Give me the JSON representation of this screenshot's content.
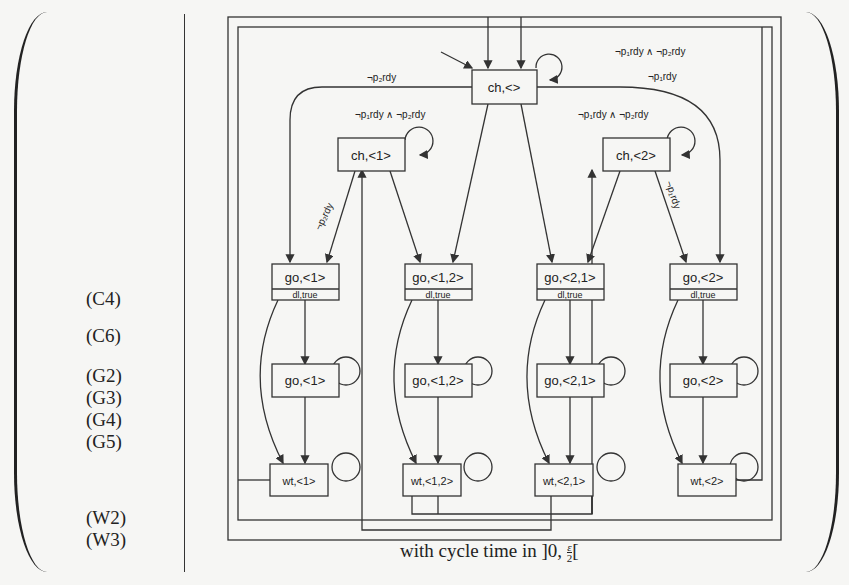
{
  "rule_labels": [
    {
      "id": "C4",
      "text": "(C4)",
      "top": 288
    },
    {
      "id": "C6",
      "text": "(C6)",
      "top": 325
    },
    {
      "id": "G2",
      "text": "(G2)",
      "top": 365
    },
    {
      "id": "G3",
      "text": "(G3)",
      "top": 387
    },
    {
      "id": "G4",
      "text": "(G4)",
      "top": 409
    },
    {
      "id": "G5",
      "text": "(G5)",
      "top": 431
    },
    {
      "id": "W2",
      "text": "(W2)",
      "top": 507
    },
    {
      "id": "W3",
      "text": "(W3)",
      "top": 529
    }
  ],
  "states": {
    "ch_empty": {
      "label": "ch,<>"
    },
    "ch_1": {
      "label": "ch,<1>"
    },
    "ch_2": {
      "label": "ch,<2>"
    },
    "go_1_dl": {
      "label": "go,<1>",
      "sub": "dl,true"
    },
    "go_12_dl": {
      "label": "go,<1,2>",
      "sub": "dl,true"
    },
    "go_21_dl": {
      "label": "go,<2,1>",
      "sub": "dl,true"
    },
    "go_2_dl": {
      "label": "go,<2>",
      "sub": "dl,true"
    },
    "go_1": {
      "label": "go,<1>"
    },
    "go_12": {
      "label": "go,<1,2>"
    },
    "go_21": {
      "label": "go,<2,1>"
    },
    "go_2": {
      "label": "go,<2>"
    },
    "wt_1": {
      "label": "wt,<1>"
    },
    "wt_12": {
      "label": "wt,<1,2>"
    },
    "wt_21": {
      "label": "wt,<2,1>"
    },
    "wt_2": {
      "label": "wt,<2>"
    }
  },
  "edge_labels": {
    "ch_empty_loop": "¬p₁rdy ∧ ¬p₂rdy",
    "ch_empty_to_go2": "¬p₁rdy",
    "ch_empty_to_go1": "¬p₂rdy",
    "ch_1_loop": "¬p₁rdy ∧ ¬p₂rdy",
    "ch_2_loop": "¬p₁rdy ∧ ¬p₂rdy",
    "ch_1_to_go1": "¬p₂rdy",
    "ch_2_to_go2": "¬p₁rdy"
  },
  "caption": {
    "text": "with cycle time in ]0,",
    "frac_num": "ε",
    "frac_den": "2",
    "suffix": "["
  }
}
